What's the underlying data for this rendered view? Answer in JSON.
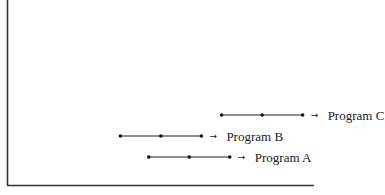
{
  "chart_data": {
    "type": "timeline",
    "title": "",
    "xlabel": "",
    "ylabel": "",
    "grid": false,
    "series": [
      {
        "name": "Program A",
        "label": "Program A",
        "row": 1,
        "points": [
          3.5,
          4.5,
          5.5
        ]
      },
      {
        "name": "Program B",
        "label": "Program B",
        "row": 2,
        "points": [
          2.8,
          3.8,
          4.8
        ]
      },
      {
        "name": "Program C",
        "label": "Program C",
        "row": 3,
        "points": [
          5.3,
          6.3,
          7.3
        ]
      }
    ],
    "arrow_glyph": "→"
  }
}
